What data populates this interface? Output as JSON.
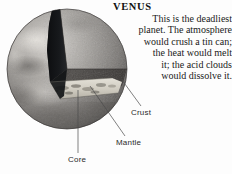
{
  "figure": {
    "title": "VENUS",
    "description_lines": [
      "This is the deadliest",
      "planet. The atmosphere",
      "would crush a tin can;",
      "the heat would melt",
      "it; the acid clouds",
      "would dissolve it."
    ],
    "callouts": [
      {
        "label": "Crust",
        "name": "crust"
      },
      {
        "label": "Mantle",
        "name": "mantle"
      },
      {
        "label": "Core",
        "name": "core"
      }
    ],
    "colors": {
      "background": "#fdfdfd",
      "surface_light": "#c9c6c2",
      "surface_mid": "#8e8b88",
      "surface_dark": "#5d5a57",
      "cut_shadow": "#15171a",
      "mantle_fill": "#4a4846",
      "core_fill": "#d8d5cc",
      "text": "#1a1a1a",
      "leader_line": "#4a4a4a"
    }
  }
}
